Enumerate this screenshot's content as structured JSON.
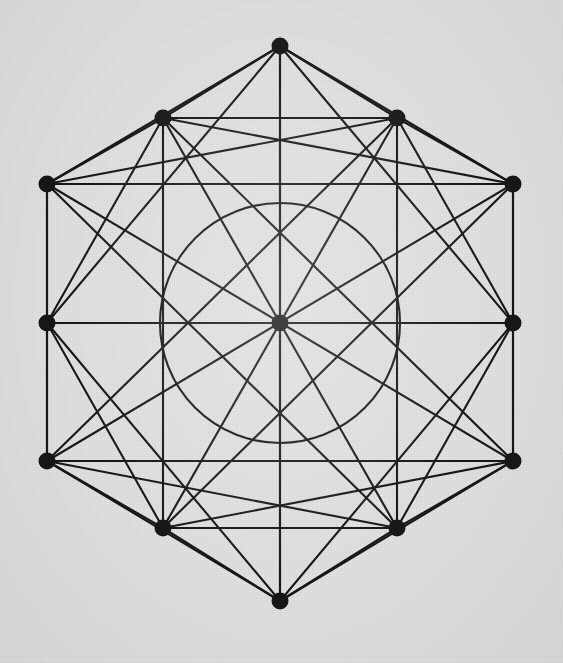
{
  "figure": {
    "type": "geometric-line-diagram",
    "canvas": {
      "width": 563,
      "height": 663
    },
    "background_color": "#e2e2e0",
    "ink_color": "#171717",
    "line_width": 2.1,
    "circle_line_width": 2.1,
    "vertex_radius": 8.5,
    "center": {
      "x": 280,
      "y": 323
    },
    "inscribed_circle": {
      "cx": 280,
      "cy": 323,
      "r": 120
    },
    "vertices": [
      {
        "id": "T",
        "name": "top-apex",
        "x": 280,
        "y": 46,
        "dot": true
      },
      {
        "id": "UL",
        "name": "upper-left",
        "x": 163,
        "y": 118,
        "dot": true
      },
      {
        "id": "UR",
        "name": "upper-right",
        "x": 397,
        "y": 118,
        "dot": true
      },
      {
        "id": "LT",
        "name": "left-top",
        "x": 47,
        "y": 184,
        "dot": true
      },
      {
        "id": "RT",
        "name": "right-top",
        "x": 513,
        "y": 184,
        "dot": true
      },
      {
        "id": "LM",
        "name": "left-middle",
        "x": 47,
        "y": 323,
        "dot": true
      },
      {
        "id": "RM",
        "name": "right-middle",
        "x": 513,
        "y": 323,
        "dot": true
      },
      {
        "id": "LB",
        "name": "left-bottom",
        "x": 47,
        "y": 461,
        "dot": true
      },
      {
        "id": "RB",
        "name": "right-bottom",
        "x": 513,
        "y": 461,
        "dot": true
      },
      {
        "id": "DL",
        "name": "lower-left",
        "x": 163,
        "y": 528,
        "dot": true
      },
      {
        "id": "DR",
        "name": "lower-right",
        "x": 397,
        "y": 528,
        "dot": true
      },
      {
        "id": "B",
        "name": "bottom-apex",
        "x": 280,
        "y": 601,
        "dot": true
      },
      {
        "id": "C",
        "name": "center",
        "x": 280,
        "y": 323,
        "dot": true
      },
      {
        "id": "iT",
        "name": "inner-top",
        "x": 280,
        "y": 184,
        "dot": false
      },
      {
        "id": "iUL",
        "name": "inner-upper-left",
        "x": 163,
        "y": 253,
        "dot": false
      },
      {
        "id": "iUR",
        "name": "inner-upper-right",
        "x": 397,
        "y": 253,
        "dot": false
      },
      {
        "id": "iLL",
        "name": "inner-lower-left",
        "x": 163,
        "y": 393,
        "dot": false
      },
      {
        "id": "iLR",
        "name": "inner-lower-right",
        "x": 397,
        "y": 393,
        "dot": false
      },
      {
        "id": "iB",
        "name": "inner-bottom",
        "x": 280,
        "y": 462,
        "dot": false
      }
    ],
    "edges": [
      {
        "from": "T",
        "to": "UL",
        "group": "outer-boundary"
      },
      {
        "from": "T",
        "to": "UR",
        "group": "outer-boundary"
      },
      {
        "from": "UL",
        "to": "LT",
        "group": "outer-boundary"
      },
      {
        "from": "UR",
        "to": "RT",
        "group": "outer-boundary"
      },
      {
        "from": "LT",
        "to": "LM",
        "group": "outer-boundary"
      },
      {
        "from": "RT",
        "to": "RM",
        "group": "outer-boundary"
      },
      {
        "from": "LM",
        "to": "LB",
        "group": "outer-boundary"
      },
      {
        "from": "RM",
        "to": "RB",
        "group": "outer-boundary"
      },
      {
        "from": "LB",
        "to": "DL",
        "group": "outer-boundary"
      },
      {
        "from": "RB",
        "to": "DR",
        "group": "outer-boundary"
      },
      {
        "from": "DL",
        "to": "B",
        "group": "outer-boundary"
      },
      {
        "from": "DR",
        "to": "B",
        "group": "outer-boundary"
      },
      {
        "from": "LT",
        "to": "RT",
        "group": "horizontal-chord"
      },
      {
        "from": "LM",
        "to": "RM",
        "group": "horizontal-chord"
      },
      {
        "from": "LB",
        "to": "RB",
        "group": "horizontal-chord"
      },
      {
        "from": "UL",
        "to": "UR",
        "group": "horizontal-chord"
      },
      {
        "from": "DL",
        "to": "DR",
        "group": "horizontal-chord"
      },
      {
        "from": "T",
        "to": "B",
        "group": "vertical-chord"
      },
      {
        "from": "UL",
        "to": "DL",
        "group": "vertical-chord"
      },
      {
        "from": "UR",
        "to": "DR",
        "group": "vertical-chord"
      },
      {
        "from": "LT",
        "to": "LB",
        "group": "vertical-chord"
      },
      {
        "from": "RT",
        "to": "RB",
        "group": "vertical-chord"
      },
      {
        "from": "T",
        "to": "LM",
        "group": "long-diagonal"
      },
      {
        "from": "T",
        "to": "RM",
        "group": "long-diagonal"
      },
      {
        "from": "B",
        "to": "LM",
        "group": "long-diagonal"
      },
      {
        "from": "B",
        "to": "RM",
        "group": "long-diagonal"
      },
      {
        "from": "LT",
        "to": "DR",
        "group": "long-diagonal"
      },
      {
        "from": "RT",
        "to": "DL",
        "group": "long-diagonal"
      },
      {
        "from": "LB",
        "to": "UR",
        "group": "long-diagonal"
      },
      {
        "from": "RB",
        "to": "UL",
        "group": "long-diagonal"
      },
      {
        "from": "LT",
        "to": "RB",
        "group": "long-diagonal"
      },
      {
        "from": "RT",
        "to": "LB",
        "group": "long-diagonal"
      },
      {
        "from": "T",
        "to": "LT",
        "group": "short-diagonal"
      },
      {
        "from": "T",
        "to": "RT",
        "group": "short-diagonal"
      },
      {
        "from": "B",
        "to": "LB",
        "group": "short-diagonal"
      },
      {
        "from": "B",
        "to": "RB",
        "group": "short-diagonal"
      },
      {
        "from": "UL",
        "to": "LM",
        "group": "short-diagonal"
      },
      {
        "from": "UR",
        "to": "RM",
        "group": "short-diagonal"
      },
      {
        "from": "DL",
        "to": "LM",
        "group": "short-diagonal"
      },
      {
        "from": "DR",
        "to": "RM",
        "group": "short-diagonal"
      },
      {
        "from": "LT",
        "to": "UR",
        "group": "short-diagonal"
      },
      {
        "from": "RT",
        "to": "UL",
        "group": "short-diagonal"
      },
      {
        "from": "LB",
        "to": "DR",
        "group": "short-diagonal"
      },
      {
        "from": "RB",
        "to": "DL",
        "group": "short-diagonal"
      },
      {
        "from": "C",
        "to": "T",
        "group": "center-spoke"
      },
      {
        "from": "C",
        "to": "B",
        "group": "center-spoke"
      },
      {
        "from": "C",
        "to": "UL",
        "group": "center-spoke"
      },
      {
        "from": "C",
        "to": "UR",
        "group": "center-spoke"
      },
      {
        "from": "C",
        "to": "DL",
        "group": "center-spoke"
      },
      {
        "from": "C",
        "to": "DR",
        "group": "center-spoke"
      },
      {
        "from": "C",
        "to": "LM",
        "group": "center-spoke"
      },
      {
        "from": "C",
        "to": "RM",
        "group": "center-spoke"
      }
    ]
  }
}
